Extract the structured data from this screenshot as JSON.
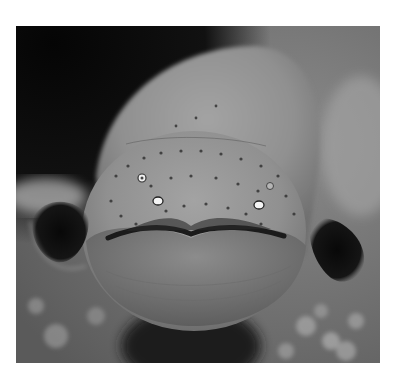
{
  "image": {
    "subject": "electric eel, head-on view",
    "style": "grayscale photograph",
    "frame": {
      "x": 16,
      "y": 26,
      "width": 364,
      "height": 337
    },
    "colors": {
      "background_page": "#ffffff",
      "dark_water": "#0e0e0e",
      "body_light": "#9a9a9a",
      "body_mid": "#7c7c7c",
      "fin_dark": "#111111",
      "eye_highlight": "#f2f2f2"
    }
  }
}
